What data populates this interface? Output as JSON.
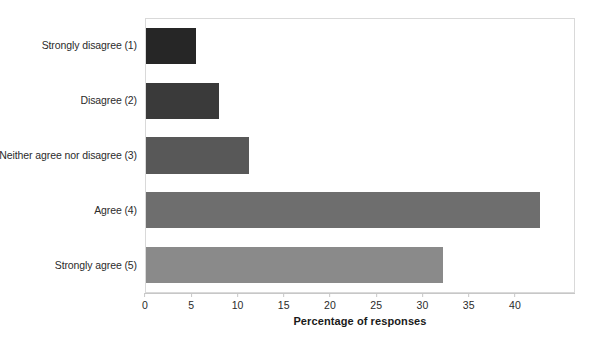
{
  "chart_data": {
    "type": "bar",
    "orientation": "horizontal",
    "title": "",
    "xlabel": "Percentage of responses",
    "ylabel": "",
    "categories": [
      "Strongly disagree (1)",
      "Disagree (2)",
      "Neither agree nor disagree (3)",
      "Agree (4)",
      "Strongly agree (5)"
    ],
    "values": [
      5.4,
      7.9,
      11.2,
      42.8,
      32.3
    ],
    "bar_colors": [
      "#262626",
      "#3a3a3a",
      "#585858",
      "#6e6e6e",
      "#8a8a8a"
    ],
    "xlim": [
      0,
      46.5
    ],
    "xticks": [
      0,
      5,
      10,
      15,
      20,
      25,
      30,
      35,
      40
    ],
    "xtick_labels": [
      "0",
      "5",
      "10",
      "15",
      "20",
      "25",
      "30",
      "35",
      "40"
    ],
    "grid": false,
    "legend": null,
    "plot_border_color": "#d9d9d9",
    "axis_color": "#c7c7c7",
    "background": "#ffffff"
  }
}
